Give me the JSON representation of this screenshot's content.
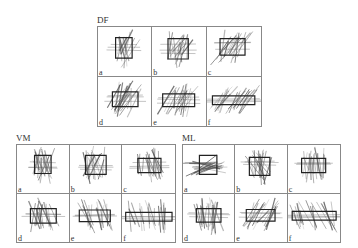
{
  "figure": {
    "groups": [
      {
        "id": "df",
        "label": "DF",
        "panels": [
          {
            "label": "a",
            "rect": [
              0.33,
              0.22,
              0.31,
              0.42
            ],
            "tilt": 75,
            "spread": "wide",
            "lines": 14
          },
          {
            "label": "b",
            "rect": [
              0.3,
              0.24,
              0.38,
              0.42
            ],
            "tilt": 78,
            "spread": "wide",
            "lines": 16
          },
          {
            "label": "c",
            "rect": [
              0.24,
              0.24,
              0.46,
              0.34
            ],
            "tilt": 68,
            "spread": "mid",
            "lines": 16
          },
          {
            "label": "d",
            "rect": [
              0.27,
              0.3,
              0.48,
              0.3
            ],
            "tilt": 70,
            "spread": "mid",
            "lines": 18
          },
          {
            "label": "e",
            "rect": [
              0.2,
              0.34,
              0.6,
              0.26
            ],
            "tilt": 68,
            "spread": "mid",
            "lines": 18
          },
          {
            "label": "f",
            "rect": [
              0.1,
              0.38,
              0.78,
              0.18
            ],
            "tilt": 60,
            "spread": "narrow",
            "lines": 20
          }
        ]
      },
      {
        "id": "vm",
        "label": "VM",
        "panels": [
          {
            "label": "a",
            "rect": [
              0.34,
              0.22,
              0.32,
              0.38
            ],
            "tilt": 92,
            "spread": "wide",
            "lines": 18
          },
          {
            "label": "b",
            "rect": [
              0.3,
              0.22,
              0.4,
              0.4
            ],
            "tilt": 90,
            "spread": "wide",
            "lines": 18
          },
          {
            "label": "c",
            "rect": [
              0.3,
              0.28,
              0.44,
              0.3
            ],
            "tilt": 100,
            "spread": "mid",
            "lines": 18
          },
          {
            "label": "d",
            "rect": [
              0.26,
              0.3,
              0.5,
              0.3
            ],
            "tilt": 95,
            "spread": "mid",
            "lines": 18
          },
          {
            "label": "e",
            "rect": [
              0.18,
              0.33,
              0.6,
              0.24
            ],
            "tilt": 100,
            "spread": "mid",
            "lines": 18
          },
          {
            "label": "f",
            "rect": [
              0.07,
              0.38,
              0.88,
              0.18
            ],
            "tilt": 98,
            "spread": "narrow",
            "lines": 18
          }
        ]
      },
      {
        "id": "ml",
        "label": "ML",
        "panels": [
          {
            "label": "a",
            "rect": [
              0.32,
              0.22,
              0.34,
              0.4
            ],
            "tilt": 10,
            "spread": "wide",
            "lines": 18
          },
          {
            "label": "b",
            "rect": [
              0.28,
              0.26,
              0.4,
              0.38
            ],
            "tilt": 100,
            "spread": "wide",
            "lines": 18
          },
          {
            "label": "c",
            "rect": [
              0.26,
              0.28,
              0.46,
              0.3
            ],
            "tilt": 95,
            "spread": "mid",
            "lines": 18
          },
          {
            "label": "d",
            "rect": [
              0.26,
              0.3,
              0.48,
              0.28
            ],
            "tilt": 95,
            "spread": "mid",
            "lines": 18
          },
          {
            "label": "e",
            "rect": [
              0.22,
              0.32,
              0.56,
              0.24
            ],
            "tilt": 60,
            "spread": "mid",
            "lines": 16
          },
          {
            "label": "f",
            "rect": [
              0.08,
              0.36,
              0.84,
              0.18
            ],
            "tilt": 110,
            "spread": "narrow",
            "lines": 18
          }
        ]
      }
    ]
  },
  "style": {
    "line_color": "#555555",
    "rect_color": "#222222",
    "border_color": "#888888"
  }
}
